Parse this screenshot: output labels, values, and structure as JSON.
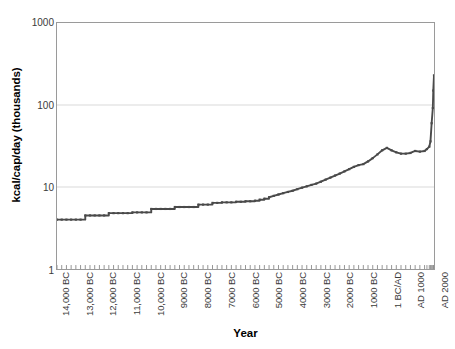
{
  "chart_data": {
    "type": "line",
    "title": "",
    "xlabel": "Year",
    "ylabel": "kcal/cap/day (thousands)",
    "yscale": "log",
    "ylim": [
      1,
      1000
    ],
    "y_ticks": [
      1000,
      100,
      10,
      1
    ],
    "y_tick_labels": [
      "1000",
      "100",
      "10",
      "1"
    ],
    "grid": "horizontal-major",
    "legend": "none",
    "line_color": "#4a4a4a",
    "marker": "small-square",
    "x_tick_labels": [
      "14,000 BC",
      "13,000 BC",
      "12,000 BC",
      "11,000 BC",
      "10,000 BC",
      "9000 BC",
      "8000 BC",
      "7000 BC",
      "6000 BC",
      "5000 BC",
      "4000 BC",
      "3000 BC",
      "2000 BC",
      "1000 BC",
      "1 BC/AD",
      "AD 1000",
      "AD 2000"
    ],
    "x_tick_years": [
      -14000,
      -13000,
      -12000,
      -11000,
      -10000,
      -9000,
      -8000,
      -7000,
      -6000,
      -5000,
      -4000,
      -3000,
      -2000,
      -1000,
      0,
      1000,
      2000
    ],
    "xlim": [
      -14000,
      2000
    ],
    "series": [
      {
        "name": "Energy capture per capita",
        "x": [
          -14000,
          -13800,
          -13600,
          -13400,
          -13200,
          -13000,
          -12800,
          -12600,
          -12400,
          -12200,
          -12000,
          -11800,
          -11600,
          -11400,
          -11200,
          -11000,
          -10800,
          -10600,
          -10400,
          -10200,
          -10000,
          -9800,
          -9600,
          -9400,
          -9200,
          -9000,
          -8800,
          -8600,
          -8400,
          -8200,
          -8000,
          -7800,
          -7600,
          -7400,
          -7200,
          -7000,
          -6800,
          -6600,
          -6400,
          -6200,
          -6000,
          -5800,
          -5600,
          -5400,
          -5200,
          -5000,
          -4800,
          -4600,
          -4400,
          -4200,
          -4000,
          -3800,
          -3600,
          -3400,
          -3200,
          -3000,
          -2800,
          -2600,
          -2400,
          -2200,
          -2000,
          -1800,
          -1600,
          -1400,
          -1200,
          -1000,
          -800,
          -600,
          -400,
          -200,
          0,
          200,
          400,
          600,
          800,
          1000,
          1200,
          1400,
          1600,
          1700,
          1800,
          1850,
          1900,
          1950,
          1970,
          2000
        ],
        "y": [
          4.0,
          4.0,
          4.0,
          4.0,
          4.0,
          4.0,
          4.5,
          4.5,
          4.5,
          4.5,
          4.5,
          4.8,
          4.8,
          4.8,
          4.8,
          4.8,
          4.9,
          4.9,
          4.9,
          4.9,
          5.4,
          5.4,
          5.4,
          5.4,
          5.4,
          5.7,
          5.7,
          5.7,
          5.7,
          5.7,
          6.1,
          6.1,
          6.1,
          6.4,
          6.4,
          6.5,
          6.5,
          6.5,
          6.6,
          6.6,
          6.7,
          6.7,
          6.8,
          7.0,
          7.2,
          7.5,
          7.8,
          8.1,
          8.4,
          8.7,
          9.0,
          9.4,
          9.8,
          10.2,
          10.6,
          11.0,
          11.6,
          12.3,
          13.0,
          13.8,
          14.6,
          15.5,
          16.5,
          17.6,
          18.5,
          19.0,
          20.5,
          22.5,
          25.0,
          28.0,
          30.0,
          28.0,
          26.5,
          25.5,
          25.5,
          26.0,
          27.5,
          27.0,
          27.5,
          29.0,
          31.0,
          36.0,
          60.0,
          92.0,
          150.0,
          230.0
        ]
      }
    ],
    "annotations": [
      "Stepwise plateaus during the Paleolithic and early Neolithic periods",
      "Local maximum near 1 BC/AD (~30 thousand kcal/cap/day)",
      "Slight decline after 1 BC/AD, recovering by AD 1000",
      "Sharp near-vertical rise after AD 1800 reaching ~230 thousand kcal/cap/day"
    ]
  }
}
